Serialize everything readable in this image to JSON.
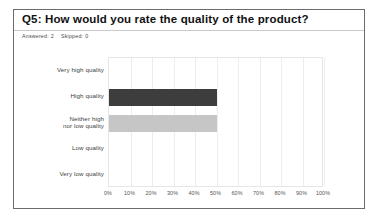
{
  "card": {
    "title": "Q5: How would you rate the quality of the product?",
    "answered_label": "Answered:",
    "answered_value": "2",
    "skipped_label": "Skipped:",
    "skipped_value": "0"
  },
  "colors": {
    "bar_dark": "#3d3d3d",
    "bar_light": "#c6c6c6",
    "card_border": "#6b6b6b",
    "divider": "#c9c9c9",
    "gridline": "#ededed",
    "plot_border": "#e6e6e6"
  },
  "chart_data": {
    "type": "bar",
    "orientation": "horizontal",
    "title": "Q5: How would you rate the quality of the product?",
    "xlabel": "",
    "ylabel": "",
    "categories": [
      "Very high quality",
      "High quality",
      "Neither high\nnor low quality",
      "Low quality",
      "Very low quality"
    ],
    "values": [
      0,
      50,
      50,
      0,
      0
    ],
    "value_unit": "%",
    "bar_colors": [
      "#3d3d3d",
      "#3d3d3d",
      "#c6c6c6",
      "#c6c6c6",
      "#c6c6c6"
    ],
    "xlim": [
      0,
      100
    ],
    "xticks": [
      0,
      10,
      20,
      30,
      40,
      50,
      60,
      70,
      80,
      90,
      100
    ],
    "xticklabels": [
      "0%",
      "10%",
      "20%",
      "30%",
      "40%",
      "50%",
      "60%",
      "70%",
      "80%",
      "90%",
      "100%"
    ],
    "grid": true,
    "legend": false
  }
}
